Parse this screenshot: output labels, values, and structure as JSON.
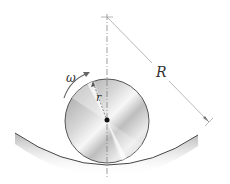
{
  "diagram": {
    "labels": {
      "omega": "ω",
      "small_r": "r",
      "big_R": "R"
    },
    "colors": {
      "line": "#444444",
      "dim_line": "#888888",
      "disc_light": "#f4f4f4",
      "disc_dark": "#a8a8a8",
      "surface_shadow": "#9a9a9a",
      "center_dot": "#111111"
    }
  }
}
